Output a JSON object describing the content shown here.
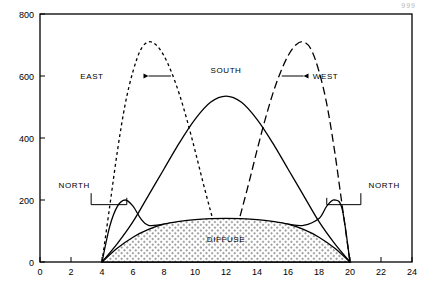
{
  "corner_code": "999",
  "chart_data": {
    "type": "line",
    "title": "",
    "xlabel": "",
    "ylabel": "",
    "xlim": [
      0,
      24
    ],
    "ylim": [
      0,
      800
    ],
    "xticks": [
      0,
      2,
      4,
      6,
      8,
      10,
      12,
      14,
      16,
      18,
      20,
      22,
      24
    ],
    "yticks": [
      0,
      200,
      400,
      600,
      800
    ],
    "grid": false,
    "legend": "inline-annotations",
    "annotations": [
      {
        "label": "EAST",
        "x": 5.4,
        "y": 600
      },
      {
        "label": "SOUTH",
        "x": 12.0,
        "y": 620
      },
      {
        "label": "WEST",
        "x": 18.6,
        "y": 600
      },
      {
        "label": "NORTH",
        "x": 4.3,
        "y": 250
      },
      {
        "label": "NORTH",
        "x": 19.8,
        "y": 250
      },
      {
        "label": "DIFFUSE",
        "x": 12.0,
        "y": 75
      }
    ],
    "series": [
      {
        "name": "EAST",
        "style": "dotted",
        "x": [
          4.0,
          4.5,
          5.0,
          5.5,
          6.0,
          6.5,
          7.0,
          7.5,
          8.0,
          8.5,
          9.0,
          9.5,
          10.0,
          10.5,
          11.0,
          11.5,
          12.0
        ],
        "values": [
          0,
          180,
          360,
          510,
          615,
          685,
          710,
          700,
          665,
          610,
          540,
          455,
          360,
          260,
          165,
          75,
          0
        ]
      },
      {
        "name": "SOUTH",
        "style": "solid",
        "x": [
          4.0,
          5.0,
          6.0,
          7.0,
          8.0,
          9.0,
          10.0,
          11.0,
          12.0,
          13.0,
          14.0,
          15.0,
          16.0,
          17.0,
          18.0,
          19.0,
          20.0
        ],
        "values": [
          0,
          60,
          130,
          215,
          300,
          385,
          460,
          515,
          535,
          515,
          460,
          385,
          300,
          215,
          130,
          60,
          0
        ]
      },
      {
        "name": "WEST",
        "style": "dashed",
        "x": [
          12.0,
          12.5,
          13.0,
          13.5,
          14.0,
          14.5,
          15.0,
          15.5,
          16.0,
          16.5,
          17.0,
          17.5,
          18.0,
          18.5,
          19.0,
          19.5,
          20.0
        ],
        "values": [
          0,
          75,
          165,
          260,
          360,
          455,
          540,
          610,
          665,
          700,
          710,
          685,
          615,
          510,
          360,
          180,
          0
        ]
      },
      {
        "name": "NORTH",
        "style": "solid",
        "x": [
          4.0,
          4.5,
          5.0,
          5.5,
          6.0,
          6.5,
          7.0,
          8.0,
          9.0,
          10.0,
          11.0,
          12.0,
          13.0,
          14.0,
          15.0,
          16.0,
          17.0,
          18.0,
          18.5,
          19.0,
          19.5,
          20.0
        ],
        "values": [
          0,
          115,
          180,
          200,
          180,
          140,
          118,
          122,
          128,
          133,
          137,
          140,
          137,
          133,
          128,
          122,
          118,
          140,
          180,
          200,
          170,
          0
        ]
      },
      {
        "name": "DIFFUSE",
        "style": "solid-filled-hatch",
        "x": [
          4.0,
          5.0,
          6.0,
          7.0,
          8.0,
          9.0,
          10.0,
          11.0,
          12.0,
          13.0,
          14.0,
          15.0,
          16.0,
          17.0,
          18.0,
          19.0,
          20.0
        ],
        "values": [
          0,
          45,
          80,
          105,
          122,
          131,
          137,
          140,
          141,
          140,
          137,
          131,
          122,
          105,
          80,
          45,
          0
        ]
      }
    ]
  }
}
